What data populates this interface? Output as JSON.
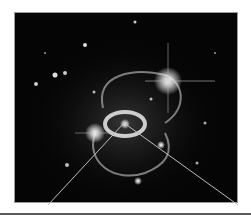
{
  "image": {
    "subject": "supernova remnant with central ring and two outer rings among stars",
    "background_color": "#050505",
    "ring_color": "#d8d8d8",
    "line_color": "#bdbdbd"
  },
  "pointer": {
    "origin": [
      124,
      123
    ],
    "ends": [
      [
        48,
        205
      ],
      [
        238,
        205
      ]
    ]
  }
}
